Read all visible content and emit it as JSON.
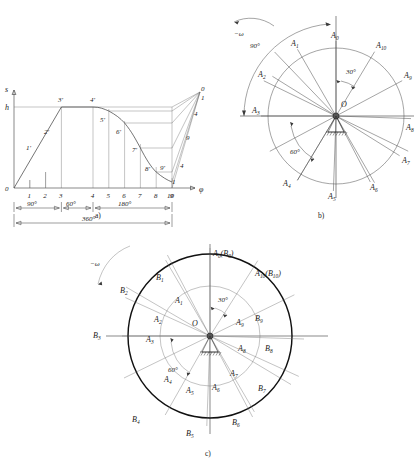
{
  "figure": {
    "captions": {
      "a": "a)",
      "b": "b)",
      "c": "c)"
    }
  },
  "diagram_a": {
    "name": "displacement-diagram",
    "axis_y_label": "s",
    "axis_x_label": "φ",
    "origin_label": "0",
    "stroke_label": "h",
    "x_ticks": [
      "1",
      "2",
      "3",
      "4",
      "5",
      "6",
      "7",
      "8",
      "9",
      "10"
    ],
    "curve_points": [
      "1'",
      "2'",
      "3'",
      "4'",
      "5'",
      "6'",
      "7'",
      "8'",
      "9'"
    ],
    "right_labels": [
      "0",
      "1",
      "4",
      "9",
      "4",
      "1"
    ],
    "dimensions": [
      {
        "label": "90°",
        "from": "0",
        "to": "3"
      },
      {
        "label": "60°",
        "from": "3",
        "to": "4"
      },
      {
        "label": "180°",
        "from": "4",
        "to": "10"
      },
      {
        "label": "360°",
        "from": "0",
        "to": "10"
      }
    ],
    "phases": {
      "rise": "90°",
      "dwell": "60°",
      "return": "180°",
      "total": "360°"
    }
  },
  "diagram_b": {
    "name": "base-circle-ray-diagram",
    "center_label": "O",
    "rotation_label": "−ω",
    "angle_marks": [
      "90°",
      "30°",
      "60°"
    ],
    "ray_labels": [
      "A_0",
      "A_1",
      "A_2",
      "A_3",
      "A_4",
      "A_5",
      "A_6",
      "A_7",
      "A_8",
      "A_9",
      "A_10"
    ],
    "rays": [
      {
        "base": "A",
        "index": "0",
        "angle_deg": 90
      },
      {
        "base": "A",
        "index": "1",
        "angle_deg": 120
      },
      {
        "base": "A",
        "index": "2",
        "angle_deg": 152
      },
      {
        "base": "A",
        "index": "3",
        "angle_deg": 180
      },
      {
        "base": "A",
        "index": "4",
        "angle_deg": 239
      },
      {
        "base": "A",
        "index": "5",
        "angle_deg": 268
      },
      {
        "base": "A",
        "index": "6",
        "angle_deg": 298
      },
      {
        "base": "A",
        "index": "7",
        "angle_deg": 328
      },
      {
        "base": "A",
        "index": "8",
        "angle_deg": 358
      },
      {
        "base": "A",
        "index": "9",
        "angle_deg": 28
      },
      {
        "base": "A",
        "index": "10",
        "angle_deg": 59
      }
    ]
  },
  "diagram_c": {
    "name": "cam-profile-construction",
    "center_label": "O",
    "rotation_label": "−ω",
    "angle_marks": [
      "30°",
      "60°"
    ],
    "combined_labels": [
      "A_0(B_0)",
      "A_10(B_10)"
    ],
    "inner_labels": [
      "A_1",
      "A_2",
      "A_3",
      "A_4",
      "A_5",
      "A_6",
      "A_7",
      "A_8",
      "A_9"
    ],
    "outer_labels": [
      "B_1",
      "B_2",
      "B_3",
      "B_4",
      "B_5",
      "B_6",
      "B_7",
      "B_8",
      "B_9"
    ],
    "rays": [
      {
        "index": "0",
        "angle_deg": 90
      },
      {
        "index": "1",
        "angle_deg": 120
      },
      {
        "index": "2",
        "angle_deg": 152
      },
      {
        "index": "3",
        "angle_deg": 180
      },
      {
        "index": "4",
        "angle_deg": 239
      },
      {
        "index": "5",
        "angle_deg": 268
      },
      {
        "index": "6",
        "angle_deg": 298
      },
      {
        "index": "7",
        "angle_deg": 328
      },
      {
        "index": "8",
        "angle_deg": 358
      },
      {
        "index": "9",
        "angle_deg": 28
      },
      {
        "index": "10",
        "angle_deg": 59
      }
    ]
  },
  "colors": {
    "ink": "#1a1a1a",
    "line": "#4a4a4a",
    "bold_line": "#111111",
    "background": "#ffffff"
  }
}
